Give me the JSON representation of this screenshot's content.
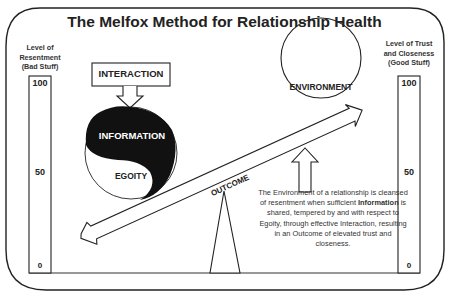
{
  "title": "The Melfox Method for Relationship Health",
  "left_scale": {
    "label_lines": [
      "Level of",
      "Resentment",
      "(Bad Stuff)"
    ],
    "ticks": [
      "100",
      "50",
      "0"
    ]
  },
  "right_scale": {
    "label_lines": [
      "Level of Trust",
      "and Closeness",
      "(Good Stuff)"
    ],
    "ticks": [
      "100",
      "50",
      "0"
    ]
  },
  "diagram": {
    "interaction": "INTERACTION",
    "information": "INFORMATION",
    "egoity": "EGOITY",
    "environment": "ENVIRONMENT",
    "outcome": "OUTCOME"
  },
  "description": {
    "part1": "The Environment of a relationship is cleansed of resentment when sufficient ",
    "bold": "Information",
    "part2": " is shared, tempered by and with respect to Egoity, through effective Interaction, resulting in an Outcome of elevated trust and closeness."
  },
  "colors": {
    "line": "#222222",
    "fill_dark": "#111111",
    "background": "#ffffff"
  }
}
